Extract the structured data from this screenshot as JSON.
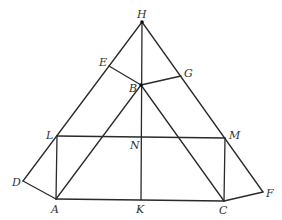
{
  "diagram": {
    "type": "geometric-construction",
    "points": {
      "H": {
        "x": 142,
        "y": 22,
        "label": "H",
        "lx": 137,
        "ly": 18
      },
      "E": {
        "x": 109,
        "y": 66,
        "label": "E",
        "lx": 99,
        "ly": 66
      },
      "G": {
        "x": 181,
        "y": 76,
        "label": "G",
        "lx": 184,
        "ly": 77
      },
      "B": {
        "x": 141,
        "y": 85,
        "label": "B",
        "lx": 129,
        "ly": 92
      },
      "L": {
        "x": 57,
        "y": 136,
        "label": "L",
        "lx": 46,
        "ly": 139
      },
      "N": {
        "x": 141,
        "y": 137,
        "label": "N",
        "lx": 130,
        "ly": 149
      },
      "M": {
        "x": 225,
        "y": 138,
        "label": "M",
        "lx": 229,
        "ly": 139
      },
      "D": {
        "x": 23,
        "y": 181,
        "label": "D",
        "lx": 12,
        "ly": 186
      },
      "A": {
        "x": 56,
        "y": 199,
        "label": "A",
        "lx": 51,
        "ly": 213
      },
      "K": {
        "x": 141,
        "y": 200,
        "label": "K",
        "lx": 136,
        "ly": 213
      },
      "C": {
        "x": 224,
        "y": 201,
        "label": "C",
        "lx": 219,
        "ly": 214
      },
      "F": {
        "x": 263,
        "y": 192,
        "label": "F",
        "lx": 266,
        "ly": 197
      }
    },
    "segments": [
      [
        "H",
        "D"
      ],
      [
        "H",
        "F"
      ],
      [
        "H",
        "K"
      ],
      [
        "E",
        "B"
      ],
      [
        "B",
        "G"
      ],
      [
        "B",
        "A"
      ],
      [
        "B",
        "C"
      ],
      [
        "L",
        "M"
      ],
      [
        "L",
        "A"
      ],
      [
        "M",
        "C"
      ],
      [
        "D",
        "A"
      ],
      [
        "A",
        "C"
      ],
      [
        "C",
        "F"
      ]
    ],
    "dots": [
      "H",
      "B"
    ]
  }
}
